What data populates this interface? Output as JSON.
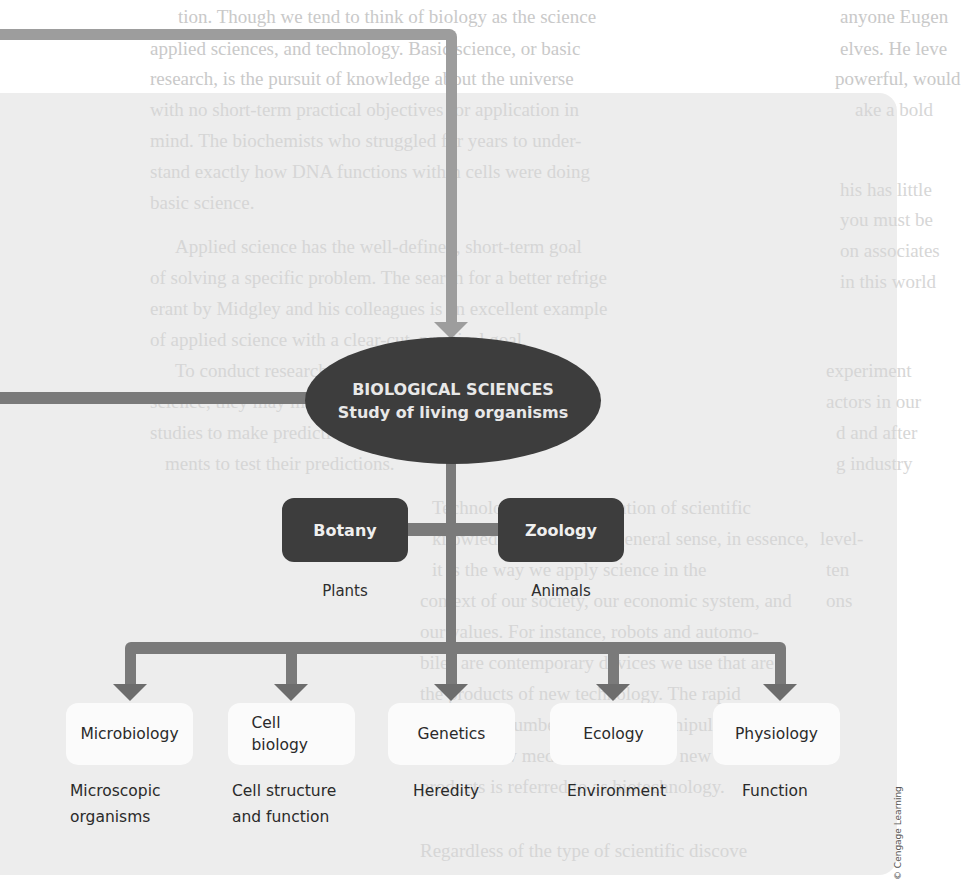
{
  "background_page": {
    "lines": [
      {
        "text": "tion. Though we tend to think of biology as the science",
        "x": 178,
        "y": 2
      },
      {
        "text": "applied sciences, and technology. Basic science, or basic",
        "x": 150,
        "y": 34
      },
      {
        "text": "research, is the pursuit of knowledge about the universe",
        "x": 150,
        "y": 64
      },
      {
        "text": "with no short-term practical objectives for application in",
        "x": 150,
        "y": 95
      },
      {
        "text": "mind. The biochemists who struggled for years to under-",
        "x": 150,
        "y": 126
      },
      {
        "text": "stand exactly how DNA functions within cells were doing",
        "x": 150,
        "y": 157
      },
      {
        "text": "basic science.",
        "x": 150,
        "y": 188
      },
      {
        "text": "Applied science has the well-defined, short-term goal",
        "x": 175,
        "y": 232
      },
      {
        "text": "of solving a specific problem. The search for a better refrige",
        "x": 150,
        "y": 263
      },
      {
        "text": "erant by Midgley and his colleagues is an excellent example",
        "x": 150,
        "y": 294
      },
      {
        "text": "of applied science with a clear-cut, practical goal.",
        "x": 150,
        "y": 325
      },
      {
        "text": "To conduct research, whether basic or applied",
        "x": 175,
        "y": 356
      },
      {
        "text": "science, they may make observations of earlier",
        "x": 150,
        "y": 387
      },
      {
        "text": "studies to make predictions, then performed experi-",
        "x": 150,
        "y": 418
      },
      {
        "text": "ments to test their predictions.",
        "x": 165,
        "y": 449
      },
      {
        "text": "Technology is the application of scientific",
        "x": 432,
        "y": 493
      },
      {
        "text": "knowledge. In the most general sense, in essence,",
        "x": 432,
        "y": 524
      },
      {
        "text": "it is the way we apply science in the",
        "x": 432,
        "y": 555
      },
      {
        "text": "context of our society, our economic system, and",
        "x": 420,
        "y": 586
      },
      {
        "text": "our values. For instance, robots and automo-",
        "x": 420,
        "y": 617
      },
      {
        "text": "biles are contemporary devices we use that are",
        "x": 420,
        "y": 648
      },
      {
        "text": "the products of new technology. The rapid",
        "x": 420,
        "y": 679
      },
      {
        "text": "expanding number of ways to manipulate DNA",
        "x": 420,
        "y": 710
      },
      {
        "text": "to make new medicines and other new",
        "x": 420,
        "y": 741
      },
      {
        "text": "products is referred to as biotechnology.",
        "x": 420,
        "y": 772
      },
      {
        "text": "Regardless of the type of scientific discove",
        "x": 420,
        "y": 836
      }
    ],
    "right_column": [
      {
        "text": "anyone Eugen",
        "x": 840,
        "y": 2
      },
      {
        "text": "elves. He leve",
        "x": 840,
        "y": 34
      },
      {
        "text": "powerful, would",
        "x": 835,
        "y": 64
      },
      {
        "text": "ake a bold",
        "x": 855,
        "y": 95
      },
      {
        "text": "his has little",
        "x": 840,
        "y": 175
      },
      {
        "text": "you must be",
        "x": 840,
        "y": 205
      },
      {
        "text": "on associates",
        "x": 840,
        "y": 236
      },
      {
        "text": "in this world",
        "x": 840,
        "y": 267
      },
      {
        "text": "experiment",
        "x": 826,
        "y": 356
      },
      {
        "text": "actors in our",
        "x": 826,
        "y": 387
      },
      {
        "text": "d and after",
        "x": 836,
        "y": 418
      },
      {
        "text": "g industry",
        "x": 836,
        "y": 449
      },
      {
        "text": "level-",
        "x": 820,
        "y": 524
      },
      {
        "text": "ten",
        "x": 826,
        "y": 555
      },
      {
        "text": "ons",
        "x": 826,
        "y": 586
      }
    ]
  },
  "diagram": {
    "root": {
      "title": "BIOLOGICAL SCIENCES",
      "subtitle": "Study of living organisms"
    },
    "branches": [
      {
        "label": "Botany",
        "sublabel": "Plants"
      },
      {
        "label": "Zoology",
        "sublabel": "Animals"
      }
    ],
    "subfields": [
      {
        "label": "Microbiology",
        "description": "Microscopic organisms"
      },
      {
        "label": "Cell biology",
        "description": "Cell structure and function"
      },
      {
        "label": "Genetics",
        "description": "Heredity"
      },
      {
        "label": "Ecology",
        "description": "Environment"
      },
      {
        "label": "Physiology",
        "description": "Function"
      }
    ],
    "colors": {
      "node_dark": "#3d3d3d",
      "node_light": "#fbfbfb",
      "connector_light": "#9d9d9d",
      "connector_dark": "#7a7a7a",
      "panel": "#ececec"
    }
  },
  "copyright": "© Cengage Learning"
}
